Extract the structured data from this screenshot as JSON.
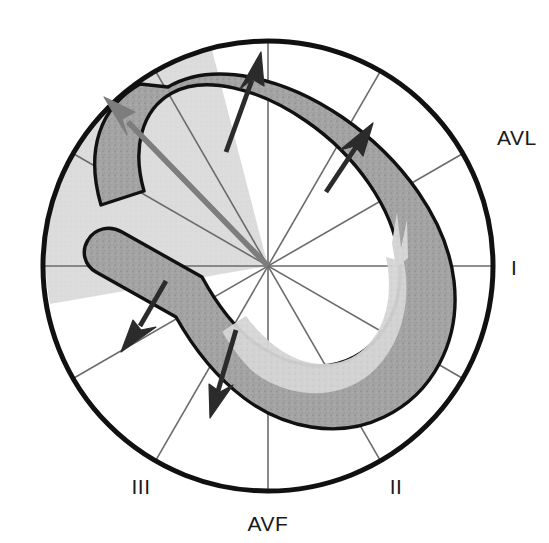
{
  "figure": {
    "background_color": "#ffffff",
    "circle": {
      "center_x": 268,
      "center_y": 266,
      "radius": 225,
      "stroke_color": "#111111",
      "stroke_width": 5
    },
    "spokes": {
      "count": 12,
      "interval_degrees": 30,
      "stroke_color": "#6b6b6b",
      "stroke_width": 1.6,
      "angles_degrees": [
        0,
        30,
        60,
        90,
        120,
        150,
        180,
        210,
        240,
        270,
        300,
        330
      ]
    },
    "shaded_wedge": {
      "label": "left axis deviation zone",
      "fill_color": "#dcdcdc",
      "start_angle_degrees": 170,
      "end_angle_degrees": 255,
      "radius": 222
    },
    "loop": {
      "label": "QRS vector loop",
      "band_fill_color": "#a3a3a3",
      "band_inner_fill_color": "#d5d5d5",
      "band_stroke_color": "#111111",
      "band_stroke_width": 3.4,
      "band_width": 42
    },
    "arrows": [
      {
        "name": "instantaneous-vector-arrow-upper-left",
        "color": "#2b2b2b",
        "tail_x": 229,
        "tail_y": 146,
        "tip_x": 260,
        "tip_y": 55,
        "width": 4.6
      },
      {
        "name": "instantaneous-vector-arrow-upper-right",
        "color": "#2b2b2b",
        "tail_x": 329,
        "tail_y": 187,
        "tip_x": 364,
        "tip_y": 128,
        "width": 4.6
      },
      {
        "name": "mean-axis-arrow",
        "color": "#7d7d7d",
        "tail_x": 268,
        "tail_y": 266,
        "tip_x": 107,
        "tip_y": 100,
        "width": 5.6
      },
      {
        "name": "instantaneous-vector-arrow-lower-left",
        "color": "#2b2b2b",
        "tail_x": 163,
        "tail_y": 287,
        "tip_x": 124,
        "tip_y": 349,
        "width": 4.6
      },
      {
        "name": "instantaneous-vector-arrow-lower-right",
        "color": "#2b2b2b",
        "tail_x": 232,
        "tail_y": 336,
        "tip_x": 213,
        "tip_y": 414,
        "width": 4.6
      }
    ]
  },
  "labels": {
    "lead_avl": {
      "text": "AVL",
      "x": 497,
      "y": 145
    },
    "lead_i": {
      "text": "I",
      "x": 511,
      "y": 275
    },
    "lead_ii": {
      "text": "II",
      "x": 396,
      "y": 494
    },
    "lead_iii": {
      "text": "III",
      "x": 141,
      "y": 494
    },
    "lead_avf": {
      "text": "AVF",
      "x": 268,
      "y": 531
    }
  }
}
